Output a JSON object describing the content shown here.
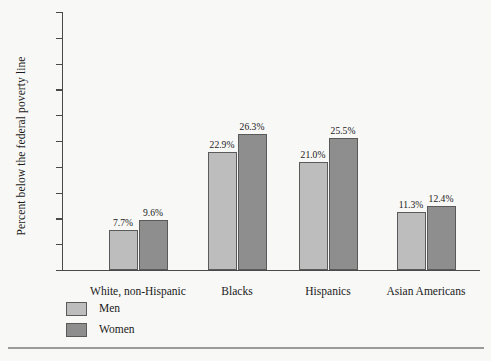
{
  "chart_data": {
    "type": "bar",
    "title": "",
    "xlabel": "",
    "ylabel": "Percent below the federal poverty line",
    "ylim": [
      0,
      50
    ],
    "ytick_step": 5,
    "ytick_labels": [
      "50.0%",
      "45.0%",
      "40.0%",
      "35.0%",
      "30.0%",
      "25.0%",
      "20.0%",
      "15.0%",
      "10.0%",
      "5.0%",
      "0.0%"
    ],
    "ytick_values": [
      50,
      45,
      40,
      35,
      30,
      25,
      20,
      15,
      10,
      5,
      0
    ],
    "grid": false,
    "legend_position": "bottom-left",
    "categories": [
      "White, non-Hispanic",
      "Blacks",
      "Hispanics",
      "Asian Americans"
    ],
    "series": [
      {
        "name": "Men",
        "color": "#bdbdbd",
        "values": [
          7.7,
          26.3,
          21.0,
          11.3
        ],
        "value_labels": [
          "7.7%",
          "22.9%",
          "21.0%",
          "11.3%"
        ]
      },
      {
        "name": "Women",
        "color": "#8e8e8e",
        "values": [
          9.6,
          26.3,
          25.5,
          12.4
        ],
        "value_labels": [
          "9.6%",
          "26.3%",
          "25.5%",
          "12.4%"
        ]
      }
    ],
    "men_values": [
      7.7,
      22.9,
      21.0,
      11.3
    ],
    "women_values": [
      9.6,
      26.3,
      25.5,
      12.4
    ]
  },
  "legend": {
    "men_label": "Men",
    "women_label": "Women"
  },
  "colors": {
    "men": "#bdbdbd",
    "women": "#8e8e8e",
    "axis": "#4a4a4a",
    "background": "#f8f8f6",
    "rule": "#9a9a9a"
  }
}
